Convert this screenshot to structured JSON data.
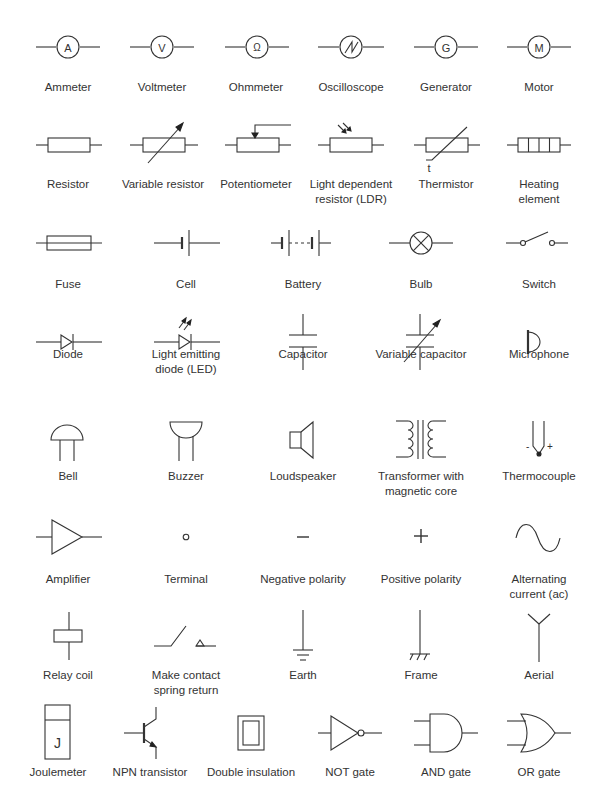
{
  "rows": [
    {
      "items": [
        {
          "label": "Ammeter",
          "glyph": "A"
        },
        {
          "label": "Voltmeter",
          "glyph": "V"
        },
        {
          "label": "Ohmmeter",
          "glyph": "Ω"
        },
        {
          "label": "Oscilloscope"
        },
        {
          "label": "Generator",
          "glyph": "G"
        },
        {
          "label": "Motor",
          "glyph": "M"
        }
      ]
    },
    {
      "items": [
        {
          "label": "Resistor"
        },
        {
          "label": "Variable resistor"
        },
        {
          "label": "Potentiometer"
        },
        {
          "label": "Light dependent\nresistor (LDR)"
        },
        {
          "label": "Thermistor",
          "glyph": "t"
        },
        {
          "label": "Heating element"
        }
      ]
    },
    {
      "items": [
        {
          "label": "Fuse"
        },
        {
          "label": "Cell"
        },
        {
          "label": "Battery"
        },
        {
          "label": "Bulb"
        },
        {
          "label": "Switch"
        }
      ]
    },
    {
      "items": [
        {
          "label": "Diode"
        },
        {
          "label": "Light emitting\ndiode (LED)"
        },
        {
          "label": "Capacitor"
        },
        {
          "label": "Variable capacitor"
        },
        {
          "label": "Microphone"
        }
      ]
    },
    {
      "items": [
        {
          "label": "Bell"
        },
        {
          "label": "Buzzer"
        },
        {
          "label": "Loudspeaker"
        },
        {
          "label": "Transformer with\nmagnetic core"
        },
        {
          "label": "Thermocouple",
          "glyph_minus": "-",
          "glyph_plus": "+"
        }
      ]
    },
    {
      "items": [
        {
          "label": "Amplifier"
        },
        {
          "label": "Terminal"
        },
        {
          "label": "Negative polarity"
        },
        {
          "label": "Positive polarity"
        },
        {
          "label": "Alternating\ncurrent (ac)"
        }
      ]
    },
    {
      "items": [
        {
          "label": "Relay coil"
        },
        {
          "label": "Make contact\nspring return"
        },
        {
          "label": "Earth"
        },
        {
          "label": "Frame"
        },
        {
          "label": "Aerial"
        }
      ]
    },
    {
      "items": [
        {
          "label": "Joulemeter",
          "glyph": "J"
        },
        {
          "label": "NPN transistor"
        },
        {
          "label": "Double insulation"
        },
        {
          "label": "NOT gate"
        },
        {
          "label": "AND gate"
        },
        {
          "label": "OR gate"
        }
      ]
    }
  ]
}
